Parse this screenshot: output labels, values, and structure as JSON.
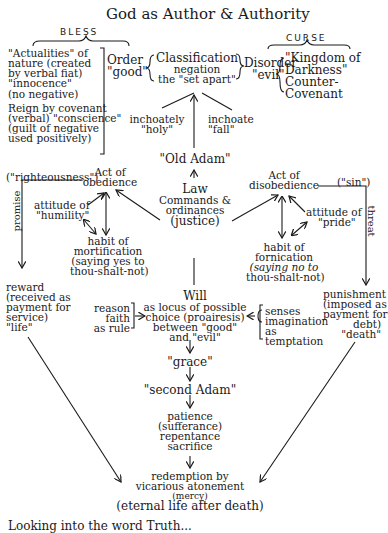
{
  "title": "God as Author & Authority",
  "bless": {
    "label": "BLESS",
    "left_column": [
      "\"Actualities\" of",
      "nature (created",
      "by verbal fiat)",
      "\"innocence\"",
      "(no negative)",
      "Reign by covenant",
      "(verbal) \"conscience\"",
      "(guilt of negative",
      "used positively)"
    ],
    "order": [
      "Order",
      "\"good\""
    ]
  },
  "classification": [
    "Classification",
    "negation",
    "the \"set apart\""
  ],
  "curse": {
    "label": "CURSE",
    "disorder": [
      "Disorder",
      "\"evil\""
    ],
    "right_column": [
      "\"Kingdom of",
      "Darkness\"",
      "Counter-",
      "Covenant"
    ]
  },
  "inchoately_holy": [
    "inchoately",
    "\"holy\""
  ],
  "inchoate_fall": [
    "inchoate",
    "\"fall\""
  ],
  "old_adam": "\"Old Adam\"",
  "law": {
    "title": "Law",
    "lines": [
      "Commands &",
      "ordinances",
      "(justice)"
    ]
  },
  "left_branch": {
    "righteousness": "(\"righteousness\")",
    "act": [
      "Act of",
      "obedience"
    ],
    "attitude": [
      "attitude of",
      "\"humility\""
    ],
    "habit": [
      "habit of",
      "mortification",
      "(saying yes to",
      "thou-shalt-not)"
    ],
    "promise": "promise",
    "reward": [
      "reward",
      "(received as",
      "payment for",
      "service)",
      "\"life\""
    ]
  },
  "right_branch": {
    "sin": "(\"sin\")",
    "act": [
      "Act of",
      "disobedience"
    ],
    "attitude": [
      "attitude of",
      "\"pride\""
    ],
    "habit": [
      "habit of",
      "fornication",
      "(saying no to",
      "thou-shalt-not)"
    ],
    "threat": "threat",
    "punishment": [
      "punishment",
      "(imposed as",
      "payment for",
      "debt)",
      "\"death\""
    ]
  },
  "will": {
    "title": "Will",
    "lines": [
      "as locus of possible",
      "choice (proairesis)",
      "between \"good\"",
      "and \"evil\""
    ]
  },
  "reason_group": [
    "reason",
    "faith",
    "as rule"
  ],
  "senses_group": [
    "senses",
    "imagination",
    "as",
    "temptation"
  ],
  "grace": "\"grace\"",
  "second_adam": "\"second Adam\"",
  "virtues": [
    "patience",
    "(sufferance)",
    "repentance",
    "sacrifice"
  ],
  "redemption": [
    "redemption by",
    "vicarious atonement",
    "(mercy)",
    "(eternal life after death)"
  ],
  "footer_fragment": "Looking into the word Truth..."
}
